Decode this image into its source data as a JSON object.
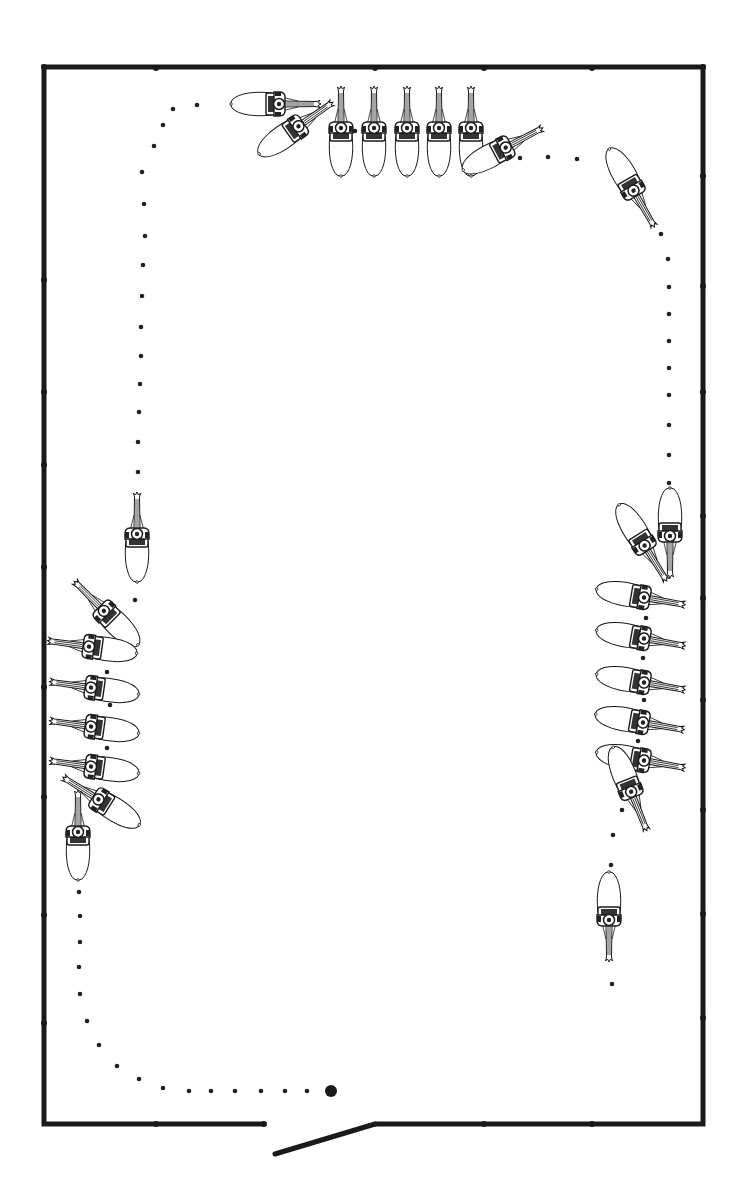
{
  "diagram": {
    "caption": "Riding arena ride diagram: horses and riders moving along a dotted track",
    "colors": {
      "line": "#1a1a1a",
      "background": "#ffffff",
      "dot": "#222222"
    },
    "arena": {
      "left": 44,
      "top": 67,
      "right": 703,
      "bottom": 1124,
      "stroke_width": 5,
      "gate": {
        "left_end_x": 264,
        "right_end_x": 375,
        "open_end": [
          275,
          1154
        ]
      },
      "markers": [
        [
          44,
          67
        ],
        [
          156,
          68
        ],
        [
          375,
          68
        ],
        [
          484,
          68
        ],
        [
          592,
          68
        ],
        [
          703,
          67
        ],
        [
          44,
          280
        ],
        [
          44,
          392
        ],
        [
          44,
          465
        ],
        [
          44,
          567
        ],
        [
          44,
          687
        ],
        [
          44,
          797
        ],
        [
          44,
          915
        ],
        [
          44,
          1023
        ],
        [
          703,
          176
        ],
        [
          703,
          286
        ],
        [
          703,
          392
        ],
        [
          703,
          516
        ],
        [
          703,
          598
        ],
        [
          703,
          700
        ],
        [
          703,
          810
        ],
        [
          703,
          914
        ],
        [
          703,
          1018
        ],
        [
          156,
          1124
        ],
        [
          484,
          1124
        ],
        [
          592,
          1124
        ]
      ]
    },
    "track_dots": [
      [
        197,
        105
      ],
      [
        173,
        109
      ],
      [
        163,
        125
      ],
      [
        154,
        146
      ],
      [
        142,
        172
      ],
      [
        144,
        204
      ],
      [
        145,
        236
      ],
      [
        143,
        265
      ],
      [
        142,
        296
      ],
      [
        141,
        327
      ],
      [
        141,
        356
      ],
      [
        140,
        384
      ],
      [
        139,
        412
      ],
      [
        138,
        442
      ],
      [
        138,
        472
      ],
      [
        135,
        600
      ],
      [
        107,
        672
      ],
      [
        110,
        705
      ],
      [
        107,
        748
      ],
      [
        79,
        892
      ],
      [
        80,
        916
      ],
      [
        80,
        942
      ],
      [
        79,
        967
      ],
      [
        80,
        994
      ],
      [
        87,
        1021
      ],
      [
        99,
        1045
      ],
      [
        117,
        1066
      ],
      [
        139,
        1079
      ],
      [
        163,
        1088
      ],
      [
        189,
        1091
      ],
      [
        211,
        1091
      ],
      [
        235,
        1091
      ],
      [
        261,
        1091
      ],
      [
        285,
        1091
      ],
      [
        307,
        1091
      ],
      [
        355,
        131
      ],
      [
        520,
        158
      ],
      [
        548,
        157
      ],
      [
        577,
        159
      ],
      [
        661,
        234
      ],
      [
        668,
        259
      ],
      [
        669,
        287
      ],
      [
        669,
        314
      ],
      [
        669,
        341
      ],
      [
        669,
        368
      ],
      [
        669,
        395
      ],
      [
        669,
        425
      ],
      [
        669,
        455
      ],
      [
        669,
        483
      ],
      [
        646,
        618
      ],
      [
        643,
        658
      ],
      [
        644,
        700
      ],
      [
        638,
        741
      ],
      [
        622,
        810
      ],
      [
        613,
        835
      ],
      [
        611,
        865
      ],
      [
        612,
        984
      ]
    ],
    "start_point": {
      "x": 331,
      "y": 1091,
      "r": 6
    },
    "horses": [
      {
        "id": "top-1",
        "x": 276,
        "y": 104,
        "rotate": 90
      },
      {
        "id": "top-2",
        "x": 296,
        "y": 128,
        "rotate": 55
      },
      {
        "id": "top-3",
        "x": 341,
        "y": 131,
        "rotate": 0
      },
      {
        "id": "top-4",
        "x": 374,
        "y": 131,
        "rotate": 0
      },
      {
        "id": "top-5",
        "x": 407,
        "y": 131,
        "rotate": 0
      },
      {
        "id": "top-6",
        "x": 439,
        "y": 131,
        "rotate": 0
      },
      {
        "id": "top-7",
        "x": 471,
        "y": 131,
        "rotate": 0
      },
      {
        "id": "top-8",
        "x": 503,
        "y": 149,
        "rotate": 62
      },
      {
        "id": "corner-tr",
        "x": 632,
        "y": 188,
        "rotate": 150
      },
      {
        "id": "right-1",
        "x": 670,
        "y": 533,
        "rotate": 180
      },
      {
        "id": "right-2",
        "x": 643,
        "y": 543,
        "rotate": 148
      },
      {
        "id": "right-3",
        "x": 641,
        "y": 597,
        "rotate": 100
      },
      {
        "id": "right-4",
        "x": 641,
        "y": 638,
        "rotate": 100
      },
      {
        "id": "right-5",
        "x": 641,
        "y": 682,
        "rotate": 100
      },
      {
        "id": "right-6",
        "x": 640,
        "y": 722,
        "rotate": 100
      },
      {
        "id": "right-7",
        "x": 641,
        "y": 760,
        "rotate": 100
      },
      {
        "id": "right-8",
        "x": 630,
        "y": 789,
        "rotate": 158
      },
      {
        "id": "right-9",
        "x": 609,
        "y": 917,
        "rotate": 180
      },
      {
        "id": "left-1",
        "x": 137,
        "y": 537,
        "rotate": 0
      },
      {
        "id": "left-2",
        "x": 106,
        "y": 613,
        "rotate": -45
      },
      {
        "id": "left-3",
        "x": 92,
        "y": 647,
        "rotate": -82
      },
      {
        "id": "left-4",
        "x": 94,
        "y": 688,
        "rotate": -82
      },
      {
        "id": "left-5",
        "x": 94,
        "y": 727,
        "rotate": -82
      },
      {
        "id": "left-6",
        "x": 94,
        "y": 767,
        "rotate": -82
      },
      {
        "id": "left-7",
        "x": 101,
        "y": 801,
        "rotate": -58
      },
      {
        "id": "left-8",
        "x": 78,
        "y": 835,
        "rotate": 0
      }
    ]
  }
}
